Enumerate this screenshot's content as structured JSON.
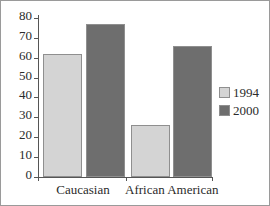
{
  "chart_data": {
    "type": "bar",
    "title": "",
    "subtitle": "",
    "xlabel": "",
    "ylabel": "",
    "categories": [
      "Caucasian",
      "African American"
    ],
    "series": [
      {
        "name": "1994",
        "values": [
          62,
          26
        ],
        "color": "#d4d4d4"
      },
      {
        "name": "2000",
        "values": [
          77,
          66
        ],
        "color": "#6e6e6e"
      }
    ],
    "ylim": [
      0,
      80
    ],
    "ytick_values": [
      0,
      10,
      20,
      30,
      40,
      50,
      60,
      70,
      80
    ],
    "ytick_labels": [
      "0",
      "10",
      "20",
      "30",
      "40",
      "50",
      "60",
      "70",
      "80"
    ],
    "grid": false,
    "legend_position": "right",
    "legend_entries": [
      "1994",
      "2000"
    ]
  },
  "axes": {
    "y_ticks": [
      {
        "label": "80",
        "value": 80
      },
      {
        "label": "70",
        "value": 70
      },
      {
        "label": "60",
        "value": 60
      },
      {
        "label": "50",
        "value": 50
      },
      {
        "label": "40",
        "value": 40
      },
      {
        "label": "30",
        "value": 30
      },
      {
        "label": "20",
        "value": 20
      },
      {
        "label": "10",
        "value": 10
      },
      {
        "label": "0",
        "value": 0
      }
    ],
    "x_categories": [
      {
        "label": "Caucasian"
      },
      {
        "label": "African American"
      }
    ]
  },
  "legend": {
    "items": [
      {
        "label": "1994",
        "color": "#d4d4d4"
      },
      {
        "label": "2000",
        "color": "#6e6e6e"
      }
    ]
  },
  "colors": {
    "series_1994": "#d4d4d4",
    "series_2000": "#6e6e6e",
    "axis": "#555555",
    "bar_border": "#8f8f8f",
    "text": "#2b2b2b",
    "frame": "#9a9a9a",
    "background": "#ffffff"
  }
}
